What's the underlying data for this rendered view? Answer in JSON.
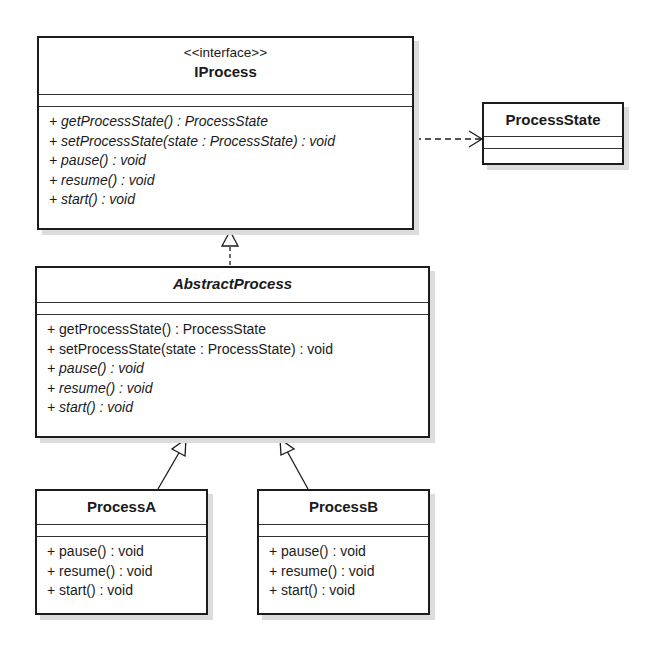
{
  "diagram": {
    "type": "uml-class-diagram",
    "classes": {
      "iprocess": {
        "stereotype": "<<interface>>",
        "name": "IProcess",
        "operations": [
          "+ getProcessState() : ProcessState",
          "+ setProcessState(state : ProcessState) : void",
          "+ pause() : void",
          "+ resume() : void",
          "+ start() : void"
        ]
      },
      "process_state": {
        "name": "ProcessState",
        "operations": []
      },
      "abstract_process": {
        "name": "AbstractProcess",
        "abstract": true,
        "operations": [
          "+ getProcessState() : ProcessState",
          "+ setProcessState(state : ProcessState) : void",
          "+ pause() : void",
          "+ resume() : void",
          "+ start() : void"
        ]
      },
      "process_a": {
        "name": "ProcessA",
        "operations": [
          "+ pause() : void",
          "+ resume() : void",
          "+ start() : void"
        ]
      },
      "process_b": {
        "name": "ProcessB",
        "operations": [
          "+ pause() : void",
          "+ resume() : void",
          "+ start() : void"
        ]
      }
    },
    "relationships": [
      {
        "type": "dependency",
        "from": "IProcess",
        "to": "ProcessState"
      },
      {
        "type": "realization",
        "from": "AbstractProcess",
        "to": "IProcess"
      },
      {
        "type": "generalization",
        "from": "ProcessA",
        "to": "AbstractProcess"
      },
      {
        "type": "generalization",
        "from": "ProcessB",
        "to": "AbstractProcess"
      }
    ],
    "colors": {
      "line": "#1c1c1c",
      "shadow": "#dcdcdc",
      "background": "#ffffff"
    }
  }
}
